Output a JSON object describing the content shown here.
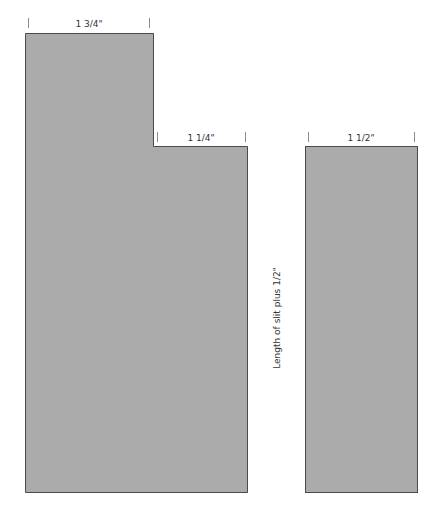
{
  "diagram": {
    "colors": {
      "fill": "#ababab",
      "stroke": "#4a4a4a",
      "tick": "#8a8a8a",
      "text": "#333333"
    },
    "left_piece": {
      "top_label": "1 3/4\"",
      "step_label": "1 1/4\""
    },
    "right_piece": {
      "top_label": "1 1/2\""
    },
    "side_label": "Length of slit plus 1/2\""
  }
}
